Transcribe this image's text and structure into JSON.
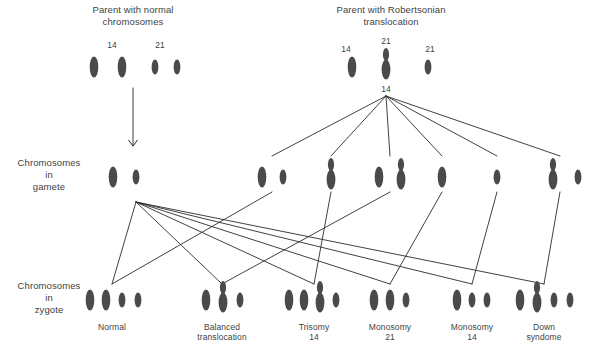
{
  "diagram": {
    "title_left": "Parent with normal\nchromosomes",
    "title_right": "Parent with Robertsonian\ntranslocation",
    "row_labels": {
      "gamete": "Chromosomes\nin\ngamete",
      "zygote": "Chromosomes\nin\nzygote"
    },
    "parent_left": {
      "labels": [
        {
          "text": "14",
          "x": 112,
          "y": 40
        },
        {
          "text": "21",
          "x": 160,
          "y": 40
        }
      ],
      "chromosomes": [
        {
          "kind": "long",
          "x": 94,
          "y": 67
        },
        {
          "kind": "long",
          "x": 122,
          "y": 67
        },
        {
          "kind": "short",
          "x": 155,
          "y": 67
        },
        {
          "kind": "short",
          "x": 177,
          "y": 67
        }
      ]
    },
    "parent_right": {
      "labels": [
        {
          "text": "14",
          "x": 346,
          "y": 44
        },
        {
          "text": "21",
          "x": 386,
          "y": 36
        },
        {
          "text": "21",
          "x": 430,
          "y": 44
        },
        {
          "text": "14",
          "x": 386,
          "y": 84
        }
      ],
      "chromosomes": [
        {
          "kind": "long",
          "x": 352,
          "y": 67
        },
        {
          "kind": "fused",
          "x": 386,
          "y": 62
        },
        {
          "kind": "short",
          "x": 428,
          "y": 67
        }
      ]
    },
    "arrow": {
      "x": 133,
      "y_top": 88,
      "y_bottom": 146
    },
    "fan_origin_parent": {
      "x": 386,
      "y": 96
    },
    "fan_origin_gamete": {
      "x": 136,
      "y": 202
    },
    "gametes": [
      {
        "name": "gamete-normal-parent",
        "chromosomes": [
          {
            "kind": "long",
            "x": 113,
            "y": 177
          },
          {
            "kind": "short",
            "x": 136,
            "y": 177
          }
        ],
        "connect_from_parent": false,
        "link_x": 136
      },
      {
        "name": "gamete-14-and-21",
        "chromosomes": [
          {
            "kind": "long",
            "x": 262,
            "y": 177
          },
          {
            "kind": "short",
            "x": 283,
            "y": 177
          }
        ],
        "connect_from_parent": true,
        "link_x": 272
      },
      {
        "name": "gamete-fused-only",
        "chromosomes": [
          {
            "kind": "fused",
            "x": 331,
            "y": 172
          }
        ],
        "connect_from_parent": true,
        "link_x": 331
      },
      {
        "name": "gamete-14-and-fused",
        "chromosomes": [
          {
            "kind": "long",
            "x": 379,
            "y": 177
          },
          {
            "kind": "fused",
            "x": 401,
            "y": 172
          }
        ],
        "connect_from_parent": true,
        "link_x": 390
      },
      {
        "name": "gamete-14-only",
        "chromosomes": [
          {
            "kind": "long",
            "x": 442,
            "y": 177
          }
        ],
        "connect_from_parent": true,
        "link_x": 442
      },
      {
        "name": "gamete-21-only",
        "chromosomes": [
          {
            "kind": "short",
            "x": 497,
            "y": 177
          }
        ],
        "connect_from_parent": true,
        "link_x": 497
      },
      {
        "name": "gamete-fused-and-21",
        "chromosomes": [
          {
            "kind": "fused",
            "x": 553,
            "y": 172
          },
          {
            "kind": "short",
            "x": 578,
            "y": 177
          }
        ],
        "connect_from_parent": true,
        "link_x": 560
      }
    ],
    "zygotes": [
      {
        "name": "zygote-normal",
        "label": "Normal",
        "label_x": 112,
        "label_y": 322,
        "link_x": 112,
        "from_gamete_index": 1,
        "chromosomes": [
          {
            "kind": "long",
            "x": 90,
            "y": 300
          },
          {
            "kind": "long",
            "x": 106,
            "y": 300
          },
          {
            "kind": "short",
            "x": 122,
            "y": 300
          },
          {
            "kind": "short",
            "x": 138,
            "y": 300
          }
        ]
      },
      {
        "name": "zygote-balanced-translocation",
        "label": "Balanced\ntranslocation",
        "label_x": 222,
        "label_y": 322,
        "link_x": 222,
        "from_gamete_index": 3,
        "chromosomes": [
          {
            "kind": "long",
            "x": 206,
            "y": 300
          },
          {
            "kind": "fused",
            "x": 223,
            "y": 295
          },
          {
            "kind": "short",
            "x": 240,
            "y": 300
          }
        ]
      },
      {
        "name": "zygote-trisomy-14",
        "label": "Trisomy\n14",
        "label_x": 314,
        "label_y": 322,
        "link_x": 314,
        "from_gamete_index": 2,
        "chromosomes": [
          {
            "kind": "long",
            "x": 289,
            "y": 300
          },
          {
            "kind": "long",
            "x": 304,
            "y": 300
          },
          {
            "kind": "fused",
            "x": 320,
            "y": 295
          },
          {
            "kind": "short",
            "x": 336,
            "y": 300
          }
        ]
      },
      {
        "name": "zygote-monosomy-21",
        "label": "Monosomy\n21",
        "label_x": 390,
        "label_y": 322,
        "link_x": 390,
        "from_gamete_index": 4,
        "chromosomes": [
          {
            "kind": "long",
            "x": 374,
            "y": 300
          },
          {
            "kind": "long",
            "x": 390,
            "y": 300
          },
          {
            "kind": "short",
            "x": 406,
            "y": 300
          }
        ]
      },
      {
        "name": "zygote-monosomy-14",
        "label": "Monosomy\n14",
        "label_x": 472,
        "label_y": 322,
        "link_x": 472,
        "from_gamete_index": 5,
        "chromosomes": [
          {
            "kind": "long",
            "x": 457,
            "y": 300
          },
          {
            "kind": "short",
            "x": 472,
            "y": 300
          },
          {
            "kind": "short",
            "x": 487,
            "y": 300
          }
        ]
      },
      {
        "name": "zygote-down-syndrome",
        "label": "Down\nsyndome",
        "label_x": 544,
        "label_y": 322,
        "link_x": 544,
        "from_gamete_index": 6,
        "chromosomes": [
          {
            "kind": "long",
            "x": 520,
            "y": 300
          },
          {
            "kind": "fused",
            "x": 537,
            "y": 295
          },
          {
            "kind": "short",
            "x": 554,
            "y": 300
          },
          {
            "kind": "short",
            "x": 570,
            "y": 300
          }
        ]
      }
    ],
    "colors": {
      "chromosome": "#4a4a4a",
      "line": "#2b2b2b",
      "text": "#3f3f3f",
      "background": "#ffffff"
    }
  }
}
